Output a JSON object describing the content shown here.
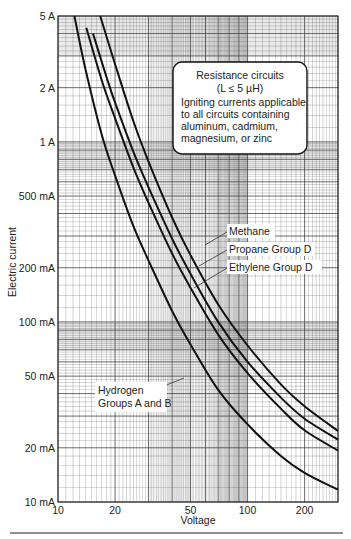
{
  "chart_data": {
    "type": "line",
    "title": "",
    "xlabel": "Voltage",
    "ylabel": "Electric current",
    "xscale": "log",
    "yscale": "log",
    "xlim": [
      10,
      300
    ],
    "ylim": [
      0.01,
      5
    ],
    "grid": true,
    "x_ticks": [
      {
        "value": 10,
        "label": "10"
      },
      {
        "value": 20,
        "label": "20"
      },
      {
        "value": 50,
        "label": "50"
      },
      {
        "value": 100,
        "label": "100"
      },
      {
        "value": 200,
        "label": "200"
      }
    ],
    "y_ticks": [
      {
        "value": 5,
        "label": "5 A"
      },
      {
        "value": 2,
        "label": "2 A"
      },
      {
        "value": 1,
        "label": "1 A"
      },
      {
        "value": 0.5,
        "label": "500 mA"
      },
      {
        "value": 0.2,
        "label": "200 mA"
      },
      {
        "value": 0.1,
        "label": "100 mA"
      },
      {
        "value": 0.05,
        "label": "50 mA"
      },
      {
        "value": 0.02,
        "label": "20 mA"
      },
      {
        "value": 0.01,
        "label": "10 mA"
      }
    ],
    "series": [
      {
        "name": "Hydrogen Groups A and B",
        "x": [
          12.2,
          14,
          17,
          20,
          25,
          30,
          40,
          50,
          70,
          100,
          150,
          200,
          300
        ],
        "y": [
          5,
          2.5,
          1.1,
          0.65,
          0.34,
          0.22,
          0.115,
          0.075,
          0.042,
          0.027,
          0.018,
          0.0145,
          0.0117
        ]
      },
      {
        "name": "Ethylene Group D",
        "x": [
          14.1,
          17,
          20,
          25,
          30,
          40,
          50,
          70,
          100,
          150,
          200,
          300
        ],
        "y": [
          4.3,
          2.2,
          1.35,
          0.72,
          0.46,
          0.24,
          0.155,
          0.085,
          0.052,
          0.033,
          0.025,
          0.0193
        ]
      },
      {
        "name": "Propane Group D",
        "x": [
          15.3,
          18,
          20,
          25,
          30,
          40,
          50,
          70,
          100,
          150,
          200,
          300
        ],
        "y": [
          4.0,
          2.3,
          1.65,
          0.88,
          0.56,
          0.29,
          0.185,
          0.1,
          0.06,
          0.038,
          0.029,
          0.0222
        ]
      },
      {
        "name": "Methane",
        "x": [
          16.7,
          20,
          25,
          30,
          40,
          50,
          70,
          100,
          150,
          200,
          300
        ],
        "y": [
          5,
          2.7,
          1.3,
          0.78,
          0.38,
          0.235,
          0.125,
          0.074,
          0.045,
          0.034,
          0.0248
        ]
      }
    ],
    "annotations": [
      {
        "text": "Methane",
        "target_series": "Methane"
      },
      {
        "text": "Propane Group D",
        "target_series": "Propane Group D"
      },
      {
        "text": "Ethylene Group D",
        "target_series": "Ethylene Group D"
      },
      {
        "text": "Hydrogen Groups A and B",
        "target_series": "Hydrogen Groups A and B"
      }
    ],
    "info_box": {
      "line1": "Resistance circuits",
      "line2_prefix": "(L ≤ 5 ",
      "line2_unit": "µH)",
      "body": [
        "Igniting currents applicable",
        "to all circuits containing",
        "aluminum, cadmium,",
        "magnesium, or zinc"
      ]
    }
  },
  "labels": {
    "methane": "Methane",
    "propane": "Propane Group D",
    "ethylene": "Ethylene Group D",
    "hydrogen_1": "Hydrogen",
    "hydrogen_2": "Groups A and B",
    "xlabel": "Voltage",
    "ylabel": "Electric current",
    "box_title": "Resistance circuits",
    "box_sub": "(L ≤ 5 µH)",
    "box_body_1": "Igniting currents applicable",
    "box_body_2": "to all circuits containing",
    "box_body_3": "aluminum, cadmium,",
    "box_body_4": "magnesium, or zinc"
  },
  "colors": {
    "curve": "#111111",
    "grid": "#333333",
    "band": "#d9d9d9"
  }
}
